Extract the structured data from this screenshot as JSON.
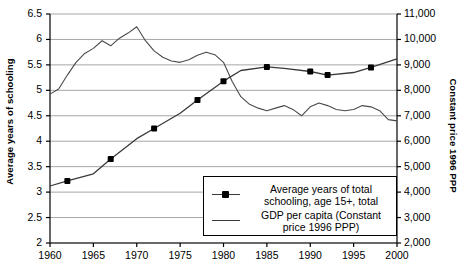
{
  "chart_data": {
    "type": "line",
    "title": "",
    "xlabel": "",
    "ylabel": "Average years of schooling",
    "y2label": "Constant price 1996 PPP",
    "xlim": [
      1960,
      2000
    ],
    "ylim": [
      2,
      6.5
    ],
    "y2lim": [
      2000,
      11000
    ],
    "grid": "horizontal",
    "legend_position": "bottom-right",
    "x_ticks": [
      "1960",
      "1965",
      "1970",
      "1975",
      "1980",
      "1985",
      "1990",
      "1995",
      "2000"
    ],
    "y_ticks_left": [
      "2",
      "2.5",
      "3",
      "3.5",
      "4",
      "4.5",
      "5",
      "5.5",
      "6",
      "6.5"
    ],
    "y_ticks_right": [
      "2,000",
      "3,000",
      "4,000",
      "5,000",
      "6,000",
      "7,000",
      "8,000",
      "9,000",
      "10,000",
      "11,000"
    ],
    "series": [
      {
        "name": "Average years of total schooling, age 15+, total",
        "axis": "left",
        "marker": "square",
        "color": "#3a3a3a",
        "x": [
          1960,
          1962,
          1965,
          1967,
          1970,
          1972,
          1975,
          1977,
          1980,
          1982,
          1985,
          1987,
          1990,
          1992,
          1995,
          1997,
          2000
        ],
        "values": [
          3.12,
          3.22,
          3.36,
          3.65,
          4.05,
          4.25,
          4.55,
          4.81,
          5.18,
          5.39,
          5.46,
          5.43,
          5.37,
          5.3,
          5.35,
          5.45,
          5.62
        ]
      },
      {
        "name": "GDP per capita (Constant price 1996 PPP)",
        "axis": "right",
        "marker": "none",
        "color": "#4a4a4a",
        "x": [
          1960,
          1961,
          1962,
          1963,
          1964,
          1965,
          1966,
          1967,
          1968,
          1969,
          1970,
          1971,
          1972,
          1973,
          1974,
          1975,
          1976,
          1977,
          1978,
          1979,
          1980,
          1981,
          1982,
          1983,
          1984,
          1985,
          1986,
          1987,
          1988,
          1989,
          1990,
          1991,
          1992,
          1993,
          1994,
          1995,
          1996,
          1997,
          1998,
          1999,
          2000
        ],
        "values": [
          7850,
          8050,
          8600,
          9100,
          9450,
          9650,
          9950,
          9750,
          10050,
          10250,
          10500,
          9950,
          9550,
          9300,
          9150,
          9100,
          9200,
          9380,
          9500,
          9400,
          9100,
          8350,
          7750,
          7450,
          7300,
          7200,
          7300,
          7400,
          7250,
          7000,
          7350,
          7500,
          7400,
          7250,
          7200,
          7250,
          7400,
          7350,
          7200,
          6850,
          6800
        ]
      }
    ]
  },
  "legend": {
    "entries": [
      {
        "label_line1": "Average years of total",
        "label_line2": "schooling, age 15+, total",
        "key": "line-with-marker"
      },
      {
        "label_line1": "GDP per capita (Constant",
        "label_line2": "price 1996 PPP)",
        "key": "line"
      }
    ]
  },
  "axes": {
    "left_title": "Average years of schooling",
    "right_title": "Constant price 1996 PPP"
  },
  "caption": ""
}
